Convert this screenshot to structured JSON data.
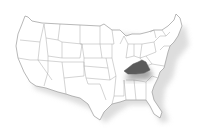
{
  "map": {
    "title": "",
    "region": "United States",
    "highlighted_state": "Kentucky",
    "colors": {
      "background": "#ffffff",
      "state_fill": "#ffffff",
      "state_stroke": "#9a9a9a",
      "highlight_fill": "#5a5a5a",
      "shadow": "#c8c8c8"
    }
  }
}
